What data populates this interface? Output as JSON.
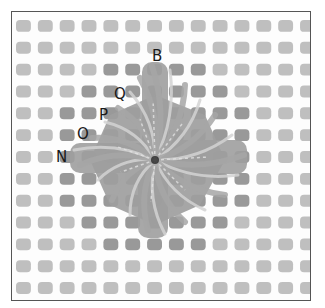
{
  "diagram": {
    "type": "needlepoint-canvas-stitch",
    "canvas": {
      "columns": 14,
      "rows": 13,
      "cell_color": "#b4b4b4",
      "dark_cell_color": "#949494",
      "background_color": "#ffffff",
      "border_color": "#555555"
    },
    "yarn": {
      "base_color": "#9e9e9e",
      "highlight_color": "#d2d2d2",
      "center_hole_color": "#2e2e2e"
    },
    "labels": [
      {
        "id": "B",
        "text": "B",
        "x": 152,
        "y": 49
      },
      {
        "id": "Q",
        "text": "Q",
        "x": 114,
        "y": 87
      },
      {
        "id": "P",
        "text": "P",
        "x": 99,
        "y": 108
      },
      {
        "id": "O",
        "text": "O",
        "x": 77,
        "y": 127
      },
      {
        "id": "N",
        "text": "N",
        "x": 56,
        "y": 150
      }
    ]
  }
}
